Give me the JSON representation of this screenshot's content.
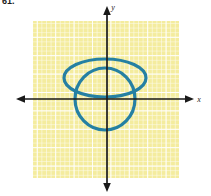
{
  "figure": {
    "problem_label": "61.",
    "background_color": "#ffffff"
  },
  "axes": {
    "x_label": "x",
    "y_label": "y",
    "axis_color": "#1a1a1a",
    "origin_px": {
      "x": 107,
      "y": 99
    }
  },
  "grid": {
    "fill_color": "#f4ec9e",
    "line_color": "#ffffff",
    "minor_step_px": 4.6,
    "major_step_px": 18.4,
    "left_px": 33,
    "top_px": 21,
    "right_px": 179,
    "bottom_px": 178
  },
  "chart_data": {
    "type": "scatter",
    "title": "",
    "subtitle": "",
    "xlabel": "x",
    "ylabel": "y",
    "grid": true,
    "legend": null,
    "xlim": [
      -4,
      4
    ],
    "ylim": [
      -4.25,
      4.25
    ],
    "curve_color": "#2580a3",
    "curve_width_px": 3.2,
    "annotations": [],
    "tick_labels": {
      "x": [],
      "y": []
    },
    "curves": [
      {
        "name": "ellipse",
        "shape": "ellipse",
        "center": {
          "x": 0,
          "y": 1.1
        },
        "semi_axis_x": 2.25,
        "semi_axis_y": 1.05,
        "center_px": {
          "x": 105,
          "y": 78
        },
        "radius_x_px": 41,
        "radius_y_px": 19,
        "rotation_deg": 0
      },
      {
        "name": "circle",
        "shape": "circle",
        "center": {
          "x": -0.1,
          "y": 0.25
        },
        "radius": 1.65,
        "center_px": {
          "x": 105,
          "y": 99
        },
        "radius_x_px": 30,
        "radius_y_px": 31,
        "rotation_deg": 0
      }
    ]
  }
}
